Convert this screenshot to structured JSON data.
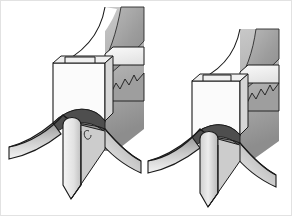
{
  "figure": {
    "name": "technical-illustration",
    "view_count": 2,
    "background_color": "#ffffff",
    "border_color": "#e2e2e2",
    "width": 292,
    "height": 216,
    "caption": "",
    "palette": {
      "outline": "#1a1a1a",
      "face_light": "#f2f2f2",
      "face_white": "#fbfbfb",
      "band_mid": "#a8a8a8",
      "band_dark": "#8f8f8f",
      "body_gray": "#b4b4b4",
      "wing_light": "#dcdcdc",
      "wing_dark": "#9a9a9a",
      "shadow_gray": "#6f6f6f",
      "tip_light": "#ededed",
      "tip_mid": "#c4c4c4"
    },
    "views": [
      {
        "id": "view-left",
        "label": "left view",
        "parts": [
          {
            "name": "notched-block",
            "label": "notched block"
          },
          {
            "name": "curved-band",
            "label": "curved band"
          },
          {
            "name": "serrated-edge",
            "label": "serrated edge"
          },
          {
            "name": "swept-wing",
            "label": "swept wing"
          },
          {
            "name": "v-tip",
            "label": "v tip"
          },
          {
            "name": "dome-arch",
            "label": "dome arch"
          }
        ]
      },
      {
        "id": "view-right",
        "label": "right view",
        "parts": [
          {
            "name": "notched-block",
            "label": "notched block"
          },
          {
            "name": "curved-band",
            "label": "curved band"
          },
          {
            "name": "serrated-edge",
            "label": "serrated edge"
          },
          {
            "name": "swept-wing",
            "label": "swept wing"
          },
          {
            "name": "v-tip",
            "label": "v tip"
          },
          {
            "name": "dome-arch",
            "label": "dome arch"
          }
        ]
      }
    ]
  }
}
